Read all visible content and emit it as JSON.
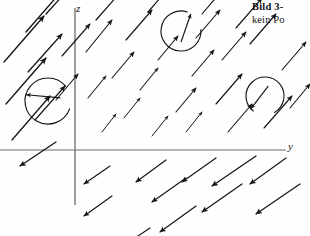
{
  "figure": {
    "background_color": "#fefefe",
    "ink_color": "#151515",
    "axis_color": "#5a5a5a",
    "width": 310,
    "height": 236
  },
  "caption": {
    "title": "Bild 3-",
    "subtitle": "kein Po"
  },
  "axes": {
    "horizontal": {
      "label": "y",
      "y_position": 150,
      "x_start": 0,
      "x_end": 286
    },
    "vertical": {
      "label": "z",
      "x_position": 75,
      "y_start": 8,
      "y_end": 205
    },
    "origin": {
      "x": 75,
      "y": 150
    }
  },
  "chart_data": {
    "type": "scatter",
    "title": "Bild 3- kein Po",
    "xlabel": "y",
    "ylabel": "z",
    "grid": false,
    "legend": null,
    "vectors": [
      {
        "x": 4,
        "y": 62,
        "dx": 40,
        "dy": -46,
        "w": 1.35
      },
      {
        "x": 6,
        "y": 104,
        "dx": 40,
        "dy": -46,
        "w": 1.35
      },
      {
        "x": 12,
        "y": 140,
        "dx": 38,
        "dy": -44,
        "w": 1.3
      },
      {
        "x": 26,
        "y": 32,
        "dx": 40,
        "dy": -46,
        "w": 1.35
      },
      {
        "x": 28,
        "y": 72,
        "dx": 34,
        "dy": -38,
        "w": 1.25
      },
      {
        "x": 35,
        "y": 120,
        "dx": 30,
        "dy": -34,
        "w": 1.2
      },
      {
        "x": 46,
        "y": 14,
        "dx": 38,
        "dy": -42,
        "w": 1.3
      },
      {
        "x": 56,
        "y": 100,
        "dx": 22,
        "dy": -26,
        "w": 1.1
      },
      {
        "x": 62,
        "y": 56,
        "dx": 28,
        "dy": -32,
        "w": 1.15
      },
      {
        "x": 86,
        "y": 52,
        "dx": 26,
        "dy": -32,
        "w": 1.15
      },
      {
        "x": 88,
        "y": 98,
        "dx": 18,
        "dy": -22,
        "w": 1.05
      },
      {
        "x": 96,
        "y": 20,
        "dx": 30,
        "dy": -34,
        "w": 1.2
      },
      {
        "x": 102,
        "y": 132,
        "dx": 14,
        "dy": -18,
        "w": 1.0
      },
      {
        "x": 112,
        "y": 78,
        "dx": 22,
        "dy": -26,
        "w": 1.1
      },
      {
        "x": 124,
        "y": 118,
        "dx": 16,
        "dy": -20,
        "w": 1.0
      },
      {
        "x": 126,
        "y": 40,
        "dx": 26,
        "dy": -30,
        "w": 1.15
      },
      {
        "x": 140,
        "y": 90,
        "dx": 18,
        "dy": -22,
        "w": 1.05
      },
      {
        "x": 148,
        "y": 12,
        "dx": 26,
        "dy": -30,
        "w": 1.15
      },
      {
        "x": 152,
        "y": 136,
        "dx": 16,
        "dy": -20,
        "w": 1.0
      },
      {
        "x": 158,
        "y": 60,
        "dx": 20,
        "dy": -24,
        "w": 1.1
      },
      {
        "x": 176,
        "y": 112,
        "dx": 20,
        "dy": -24,
        "w": 1.1
      },
      {
        "x": 186,
        "y": 132,
        "dx": 16,
        "dy": -20,
        "w": 1.0
      },
      {
        "x": 192,
        "y": 76,
        "dx": 22,
        "dy": -26,
        "w": 1.1
      },
      {
        "x": 196,
        "y": 38,
        "dx": 24,
        "dy": -28,
        "w": 1.15
      },
      {
        "x": 202,
        "y": 14,
        "dx": 24,
        "dy": -28,
        "w": 1.15
      },
      {
        "x": 216,
        "y": 104,
        "dx": 26,
        "dy": -30,
        "w": 1.15
      },
      {
        "x": 222,
        "y": 60,
        "dx": 24,
        "dy": -28,
        "w": 1.15
      },
      {
        "x": 228,
        "y": 132,
        "dx": 24,
        "dy": -28,
        "w": 1.1
      },
      {
        "x": 236,
        "y": 28,
        "dx": 26,
        "dy": -30,
        "w": 1.15
      },
      {
        "x": 250,
        "y": 44,
        "dx": 26,
        "dy": -30,
        "w": 1.15
      },
      {
        "x": 264,
        "y": 128,
        "dx": 28,
        "dy": -32,
        "w": 1.15
      },
      {
        "x": 282,
        "y": 70,
        "dx": 24,
        "dy": -28,
        "w": 1.1
      },
      {
        "x": 290,
        "y": 108,
        "dx": 20,
        "dy": -24,
        "w": 1.1
      },
      {
        "x": 56,
        "y": 142,
        "dx": -36,
        "dy": 24,
        "w": 1.25
      },
      {
        "x": 110,
        "y": 166,
        "dx": -26,
        "dy": 18,
        "w": 1.15
      },
      {
        "x": 112,
        "y": 196,
        "dx": -28,
        "dy": 20,
        "w": 1.15
      },
      {
        "x": 166,
        "y": 160,
        "dx": -30,
        "dy": 22,
        "w": 1.2
      },
      {
        "x": 186,
        "y": 178,
        "dx": -34,
        "dy": 24,
        "w": 1.2
      },
      {
        "x": 196,
        "y": 206,
        "dx": -36,
        "dy": 26,
        "w": 1.2
      },
      {
        "x": 216,
        "y": 158,
        "dx": -34,
        "dy": 24,
        "w": 1.2
      },
      {
        "x": 242,
        "y": 184,
        "dx": -40,
        "dy": 28,
        "w": 1.25
      },
      {
        "x": 256,
        "y": 156,
        "dx": -44,
        "dy": 30,
        "w": 1.25
      },
      {
        "x": 286,
        "y": 158,
        "dx": -36,
        "dy": 26,
        "w": 1.2
      },
      {
        "x": 300,
        "y": 184,
        "dx": -44,
        "dy": 30,
        "w": 1.25
      },
      {
        "x": 150,
        "y": 228,
        "dx": -30,
        "dy": 20,
        "w": 1.15
      }
    ],
    "loops": [
      {
        "cx": 48,
        "cy": 101,
        "r": 23,
        "gap_start": -40,
        "gap_end": 20,
        "arrow_angle": 196,
        "spoke": true
      },
      {
        "cx": 181,
        "cy": 31,
        "r": 20,
        "gap_start": -72,
        "gap_end": -4,
        "arrow_angle": 300,
        "spoke": true
      },
      {
        "cx": 265,
        "cy": 96,
        "r": 19,
        "gap_start": 60,
        "gap_end": 128,
        "arrow_angle": 138,
        "spoke": true
      }
    ]
  }
}
